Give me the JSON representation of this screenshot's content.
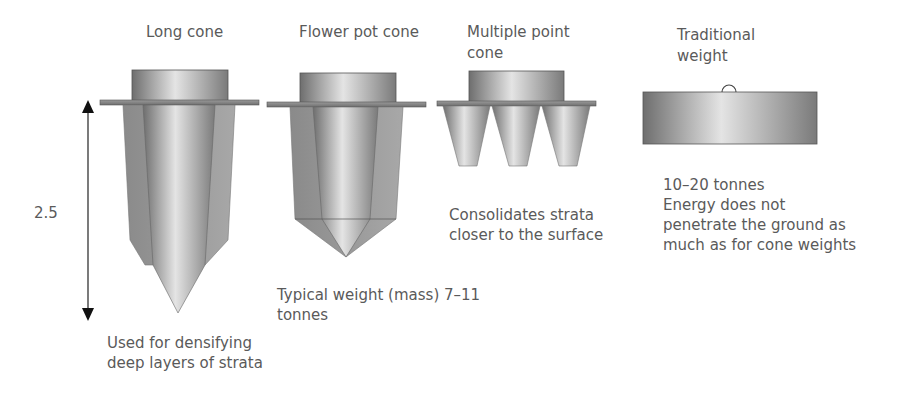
{
  "diagram": {
    "dimension_label": "2.5",
    "weights": [
      {
        "title": "Long cone",
        "caption": [
          "Used for densifying",
          "deep layers of strata"
        ]
      },
      {
        "title": "Flower pot cone",
        "caption": [
          "Typical weight (mass) 7–11",
          "tonnes"
        ]
      },
      {
        "title_lines": [
          "Multiple point",
          "cone"
        ],
        "caption": [
          "Consolidates strata",
          "closer to the surface"
        ]
      },
      {
        "title_lines": [
          "Traditional",
          "weight"
        ],
        "caption": [
          "10–20 tonnes",
          "Energy does not",
          "penetrate the ground as",
          "much as for cone weights"
        ]
      }
    ],
    "colors": {
      "metal_dark": "#7a7a7a",
      "metal_light": "#e0e0e0",
      "outline": "#555555",
      "text": "#5a5a5a"
    }
  }
}
